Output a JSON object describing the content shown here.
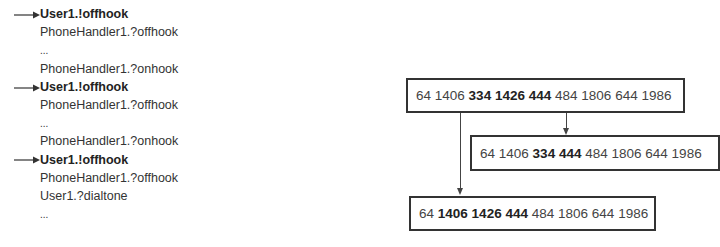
{
  "trace": {
    "lines": [
      {
        "text": "User1.!offhook",
        "bold": true,
        "arrow": true
      },
      {
        "text": "PhoneHandler1.?offhook",
        "bold": false,
        "arrow": false
      },
      {
        "text": "...",
        "bold": false,
        "arrow": false
      },
      {
        "text": "PhoneHandler1.?onhook",
        "bold": false,
        "arrow": false
      },
      {
        "text": "User1.!offhook",
        "bold": true,
        "arrow": true
      },
      {
        "text": "PhoneHandler1.?offhook",
        "bold": false,
        "arrow": false
      },
      {
        "text": "...",
        "bold": false,
        "arrow": false
      },
      {
        "text": "PhoneHandler1.?onhook",
        "bold": false,
        "arrow": false
      },
      {
        "text": "User1.!offhook",
        "bold": true,
        "arrow": true
      },
      {
        "text": "PhoneHandler1.?offhook",
        "bold": false,
        "arrow": false
      },
      {
        "text": "User1.?dialtone",
        "bold": false,
        "arrow": false
      },
      {
        "text": "...",
        "bold": false,
        "arrow": false
      }
    ]
  },
  "sequences": {
    "top": {
      "tokens": [
        {
          "t": "64",
          "b": false
        },
        {
          "t": "1406",
          "b": false
        },
        {
          "t": "334",
          "b": true
        },
        {
          "t": "1426",
          "b": true
        },
        {
          "t": "444",
          "b": true
        },
        {
          "t": "484",
          "b": false
        },
        {
          "t": "1806",
          "b": false
        },
        {
          "t": "644",
          "b": false
        },
        {
          "t": "1986",
          "b": false
        }
      ]
    },
    "middle": {
      "tokens": [
        {
          "t": "64",
          "b": false
        },
        {
          "t": "1406",
          "b": false
        },
        {
          "t": "334",
          "b": true
        },
        {
          "t": "444",
          "b": true
        },
        {
          "t": "484",
          "b": false
        },
        {
          "t": "1806",
          "b": false
        },
        {
          "t": "644",
          "b": false
        },
        {
          "t": "1986",
          "b": false
        }
      ]
    },
    "bottom": {
      "tokens": [
        {
          "t": "64",
          "b": false
        },
        {
          "t": "1406",
          "b": true
        },
        {
          "t": "1426",
          "b": true
        },
        {
          "t": "444",
          "b": true
        },
        {
          "t": "484",
          "b": false
        },
        {
          "t": "1806",
          "b": false
        },
        {
          "t": "644",
          "b": false
        },
        {
          "t": "1986",
          "b": false
        }
      ]
    }
  },
  "colors": {
    "text": "#333333",
    "bold_text": "#222222",
    "border": "#333333",
    "background": "#ffffff"
  }
}
